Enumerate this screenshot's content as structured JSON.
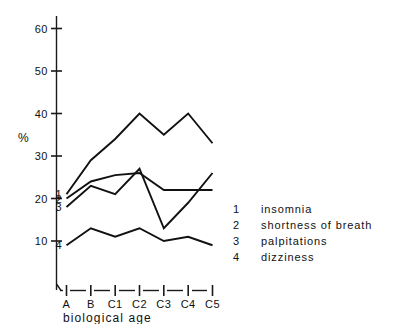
{
  "chart_data": {
    "type": "line",
    "title": "",
    "xlabel": "biological age",
    "ylabel": "%",
    "categories": [
      "A",
      "B",
      "C1",
      "C2",
      "C3",
      "C4",
      "C5"
    ],
    "ylim": [
      5,
      64
    ],
    "yticks": [
      10,
      20,
      30,
      40,
      50,
      60
    ],
    "ytick_labels": [
      "10",
      "20",
      "30",
      "40",
      "50",
      "60"
    ],
    "grid": false,
    "legend_position": "right",
    "series": [
      {
        "name": "insomnia",
        "key": "1",
        "values": [
          21,
          29,
          34,
          40,
          35,
          40,
          33
        ]
      },
      {
        "name": "shortness of breath",
        "key": "2",
        "values": [
          20,
          24,
          25.5,
          26,
          22,
          22,
          22
        ]
      },
      {
        "name": "palpitations",
        "key": "3",
        "values": [
          18,
          23,
          21,
          27,
          13,
          19,
          26
        ]
      },
      {
        "name": "dizziness",
        "key": "4",
        "values": [
          9,
          13,
          11,
          13,
          10,
          11,
          9
        ]
      }
    ]
  },
  "axes": {
    "y_unit_label": "%",
    "x_title": "biological age"
  },
  "series_tags": [
    {
      "key": "1"
    },
    {
      "key": "2"
    },
    {
      "key": "3"
    },
    {
      "key": "4"
    }
  ],
  "legend": {
    "rows": [
      {
        "key": "1",
        "label": "insomnia"
      },
      {
        "key": "2",
        "label": "shortness of breath"
      },
      {
        "key": "3",
        "label": "palpitations"
      },
      {
        "key": "4",
        "label": "dizziness"
      }
    ]
  }
}
